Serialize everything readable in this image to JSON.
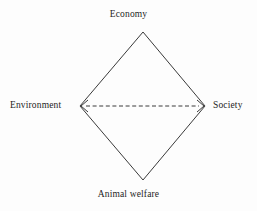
{
  "diagram": {
    "background_color": "#fdfdfd",
    "line_color": "#3a3a3a",
    "text_color": "#1d1d1d",
    "nodes": {
      "top": {
        "label": "Economy"
      },
      "left": {
        "label": "Environment"
      },
      "right": {
        "label": "Society"
      },
      "bottom": {
        "label": "Animal welfare"
      }
    },
    "connector": {
      "style": "dashed",
      "arrows": "both",
      "from": "Environment",
      "to": "Society"
    }
  }
}
